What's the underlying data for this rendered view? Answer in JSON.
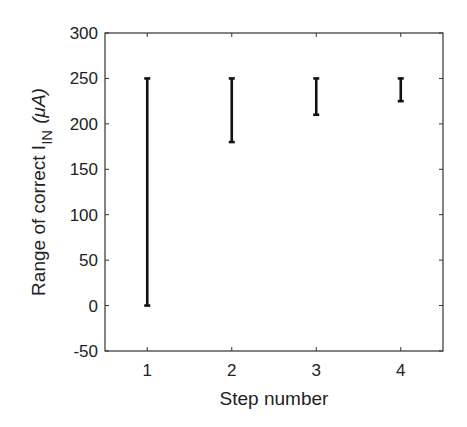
{
  "chart_data": {
    "type": "errorbar",
    "title": "",
    "xlabel": "Step number",
    "ylabel": {
      "prefix": "Range of correct I",
      "subscript": "IN",
      "unit": "(μA)"
    },
    "categories": [
      "1",
      "2",
      "3",
      "4"
    ],
    "x": [
      1,
      2,
      3,
      4
    ],
    "ranges": [
      {
        "step": 1,
        "low": 0,
        "high": 250
      },
      {
        "step": 2,
        "low": 180,
        "high": 250
      },
      {
        "step": 3,
        "low": 210,
        "high": 250
      },
      {
        "step": 4,
        "low": 225,
        "high": 250
      }
    ],
    "ylim": [
      -50,
      300
    ],
    "xlim": [
      0.5,
      4.5
    ],
    "yticks": [
      -50,
      0,
      50,
      100,
      150,
      200,
      250,
      300
    ],
    "xticks": [
      1,
      2,
      3,
      4
    ],
    "grid": false,
    "legend": null,
    "color": "#111111"
  }
}
